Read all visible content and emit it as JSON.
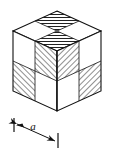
{
  "figure": {
    "shape": "cube",
    "colors": {
      "outline": "#111111",
      "hatch": "#222222",
      "fill_light": "#ffffff",
      "background": "#ffffff"
    },
    "dimension": {
      "label": "a",
      "label_style": "italic",
      "arrow_start_tick": true,
      "arrow_end_tick": true,
      "arrowheads": "both"
    },
    "faces": {
      "top": {
        "name": "top-face",
        "hatch_angle": "horizontal",
        "cells": [
          "hatched",
          "white",
          "white",
          "hatched"
        ]
      },
      "left": {
        "name": "left-face",
        "hatch_angle": "diagonal-45",
        "cells": [
          "white",
          "hatched",
          "hatched",
          "white"
        ]
      },
      "right": {
        "name": "right-face",
        "hatch_angle": "diagonal-45",
        "cells": [
          "hatched",
          "white",
          "white",
          "hatched"
        ]
      }
    }
  }
}
